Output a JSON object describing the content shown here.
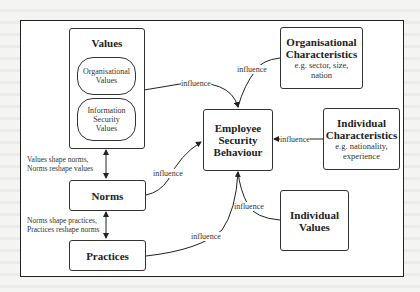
{
  "diagram": {
    "values_box": {
      "title": "Values",
      "items": [
        {
          "line1": "Organisational",
          "line2": "Values",
          "line3": ""
        },
        {
          "line1": "Information",
          "line2": "Security",
          "line3": "Values"
        }
      ]
    },
    "norms_box": {
      "title": "Norms"
    },
    "practices_box": {
      "title": "Practices"
    },
    "central_box": {
      "line1": "Employee",
      "line2": "Security",
      "line3": "Behaviour"
    },
    "org_characteristics": {
      "line1": "Organisational",
      "line2": "Characteristics",
      "sub1": "e.g. sector, size,",
      "sub2": "nation"
    },
    "ind_characteristics": {
      "line1": "Individual",
      "line2": "Characteristics",
      "sub1": "e.g. nationality,",
      "sub2": "experience"
    },
    "individual_values": {
      "line1": "Individual",
      "line2": "Values"
    },
    "notes": {
      "values_norms_1": "Values shape norms,",
      "values_norms_2": "Norms reshape values",
      "norms_practices_1": "Norms shape practices,",
      "norms_practices_2": "Practices reshape norms"
    },
    "edge_labels": {
      "values_to_esb": "influence",
      "org_to_esb": "influence",
      "ind_char_to_esb": "influence",
      "norms_to_esb": "influence",
      "practices_to_esb": "influence",
      "ind_values_to_esb": "influence"
    }
  }
}
